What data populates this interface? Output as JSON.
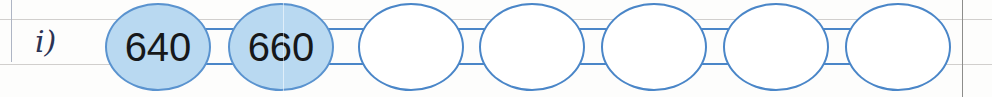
{
  "worksheet": {
    "item_label": "i)",
    "margin_rules": {
      "vertical_left": true,
      "vertical_right": true,
      "horizontal_top": true,
      "horizontal_bottom": true
    },
    "colors": {
      "bubble_border": "#4a86c8",
      "bubble_fill_filled": "#b9d9f1",
      "bubble_fill_empty": "#ffffff",
      "number_text": "#16181a",
      "handwriting_ink": "#2b3354",
      "rule_line": "#c9c7c4"
    },
    "sequence_chain": {
      "total_cells": 7,
      "filled_count": 2,
      "empty_count": 5,
      "cells": [
        {
          "index": 1,
          "value": "640",
          "filled": true,
          "left": 105
        },
        {
          "index": 2,
          "value": "660",
          "filled": true,
          "left": 228
        },
        {
          "index": 3,
          "value": "",
          "filled": false,
          "left": 358
        },
        {
          "index": 4,
          "value": "",
          "filled": false,
          "left": 479
        },
        {
          "index": 5,
          "value": "",
          "filled": false,
          "left": 601
        },
        {
          "index": 6,
          "value": "",
          "filled": false,
          "left": 723
        },
        {
          "index": 7,
          "value": "",
          "filled": false,
          "left": 845
        }
      ],
      "connectors": [
        {
          "index": 1,
          "left": 203,
          "width": 33
        },
        {
          "index": 2,
          "left": 326,
          "width": 40
        },
        {
          "index": 3,
          "left": 448,
          "width": 39
        },
        {
          "index": 4,
          "left": 570,
          "width": 39
        },
        {
          "index": 5,
          "left": 692,
          "width": 39
        },
        {
          "index": 6,
          "left": 814,
          "width": 39
        }
      ]
    }
  }
}
